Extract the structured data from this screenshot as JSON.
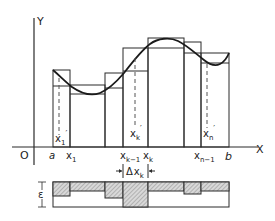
{
  "diagram": {
    "axes": {
      "x_label": "X",
      "y_label": "Y",
      "origin_label": "O"
    },
    "partition_labels": {
      "a": "a",
      "x1": "x",
      "x1_sub": "1",
      "xk1": "x",
      "xk1_sub": "k−1",
      "xk": "x",
      "xk_sub": "k",
      "xn1": "x",
      "xn1_sub": "n−1",
      "b": "b"
    },
    "sample_point_labels": {
      "x1p": "x",
      "x1p_sub": "1",
      "xkp": "x",
      "xkp_sub": "k",
      "xnp": "x",
      "xnp_sub": "n",
      "prime": "′"
    },
    "strip_labels": {
      "epsilon": "ε",
      "delta": "Δ",
      "delta_x": "x",
      "delta_sub": "k"
    },
    "colors": {
      "line": "#2a2a2a",
      "hatch": "#8a8a8a",
      "hatch_bg": "#d8d8d8",
      "background": "#ffffff"
    },
    "partition_x_px": [
      53,
      70,
      105,
      123,
      148,
      184,
      201,
      229
    ],
    "upper_tops_px": [
      70,
      85,
      73,
      48,
      38,
      42,
      53
    ],
    "lower_tops_px": [
      86,
      94,
      88,
      71,
      48,
      53,
      63
    ],
    "strip_fill_bottoms_px": [
      196,
      191,
      198,
      207,
      191,
      194,
      191
    ]
  }
}
